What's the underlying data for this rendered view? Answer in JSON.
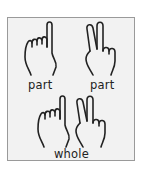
{
  "diagram": {
    "top_left": {
      "gesture": "one-finger-hand",
      "label": "part"
    },
    "top_right": {
      "gesture": "two-finger-hand",
      "label": "part"
    },
    "bottom": {
      "gestures": [
        "one-finger-hand",
        "two-finger-hand"
      ],
      "label": "whole"
    }
  },
  "colors": {
    "frame_border": "#9a9a9a",
    "frame_fill": "#f2f2f2",
    "stroke": "#222222"
  }
}
